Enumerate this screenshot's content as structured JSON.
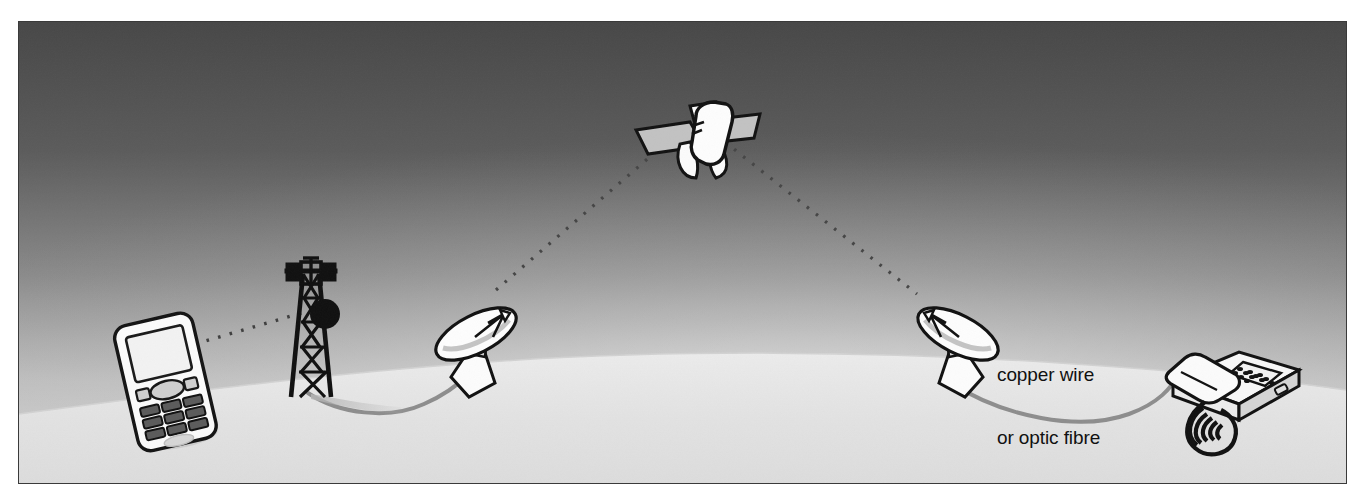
{
  "diagram": {
    "frame": {
      "x": 18,
      "y": 21,
      "width": 1327,
      "height": 461,
      "border_color": "#3a3a3a"
    },
    "palette": {
      "sky_top": "#4a4a4a",
      "sky_mid": "#8e8e8e",
      "sky_glow": "#e8e8e8",
      "ground": "#e3e3e3",
      "ground_shadow": "#c9c9c9",
      "ink": "#151515",
      "object_fill": "#ffffff",
      "object_shade": "#c0c0c0",
      "panel_gray": "#bcbcbc",
      "cable": "#8a8a8a",
      "dot_beam": "#4e4e4e",
      "label_text": "#111111"
    },
    "labels": [
      {
        "id": "cable-label",
        "line1": "copper wire",
        "line2": "or optic fibre",
        "x": 996,
        "y": 320
      }
    ],
    "nodes": [
      {
        "id": "mobile-phone",
        "name": "mobile phone handset",
        "x": 104,
        "y": 308,
        "width": 98,
        "height": 128,
        "rotation_deg": -14
      },
      {
        "id": "cell-tower",
        "name": "cellular mast / base station tower",
        "x": 268,
        "y": 238,
        "width": 58,
        "height": 152
      },
      {
        "id": "earth-station-left",
        "name": "satellite dish uplink earth station",
        "x": 412,
        "y": 279,
        "width": 88,
        "height": 98
      },
      {
        "id": "satellite",
        "name": "communications satellite",
        "x": 615,
        "y": 78,
        "width": 128,
        "height": 78
      },
      {
        "id": "earth-station-right",
        "name": "satellite dish downlink earth station",
        "x": 896,
        "y": 279,
        "width": 88,
        "height": 98
      },
      {
        "id": "desk-telephone",
        "name": "fixed line desk telephone",
        "x": 1150,
        "y": 312,
        "width": 128,
        "height": 118
      }
    ],
    "links": [
      {
        "id": "link-radio-mobile-tower",
        "name": "radio link mobile to tower",
        "style": "dotted",
        "from": "mobile-phone",
        "to": "cell-tower"
      },
      {
        "id": "link-cable-tower-dish",
        "name": "ground cable tower to earth station",
        "style": "solid-curve",
        "from": "cell-tower",
        "to": "earth-station-left"
      },
      {
        "id": "link-uplink",
        "name": "satellite uplink beam",
        "style": "dotted",
        "from": "earth-station-left",
        "to": "satellite"
      },
      {
        "id": "link-downlink",
        "name": "satellite downlink beam",
        "style": "dotted",
        "from": "satellite",
        "to": "earth-station-right"
      },
      {
        "id": "link-cable-dish-phone",
        "name": "copper wire or optic fibre to telephone",
        "style": "solid-curve",
        "from": "earth-station-right",
        "to": "desk-telephone"
      }
    ]
  }
}
